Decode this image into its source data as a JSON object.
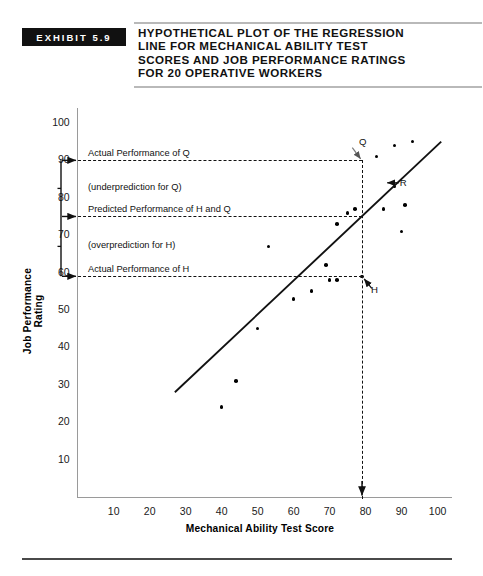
{
  "exhibit": {
    "badge": "EXHIBIT 5.9",
    "title_lines": [
      "HYPOTHETICAL PLOT OF THE REGRESSION",
      "LINE FOR MECHANICAL ABILITY TEST",
      "SCORES AND JOB PERFORMANCE RATINGS",
      "FOR 20 OPERATIVE WORKERS"
    ]
  },
  "chart_data": {
    "type": "scatter",
    "title": "Hypothetical Plot of the Regression Line for Mechanical Ability Test Scores and Job Performance Ratings for 20 Operative Workers",
    "xlabel": "Mechanical Ability Test Score",
    "ylabel": "Job Performance Rating",
    "xlim": [
      0,
      104
    ],
    "ylim": [
      0,
      104
    ],
    "xticks": [
      10,
      20,
      30,
      40,
      50,
      60,
      70,
      80,
      90,
      100
    ],
    "yticks": [
      10,
      20,
      30,
      40,
      50,
      60,
      70,
      80,
      90,
      100
    ],
    "grid": false,
    "legend": "none",
    "points": [
      {
        "x": 40,
        "y": 24
      },
      {
        "x": 44,
        "y": 31
      },
      {
        "x": 50,
        "y": 45
      },
      {
        "x": 53,
        "y": 67
      },
      {
        "x": 60,
        "y": 53
      },
      {
        "x": 65,
        "y": 55
      },
      {
        "x": 69,
        "y": 62
      },
      {
        "x": 70,
        "y": 58
      },
      {
        "x": 72,
        "y": 58
      },
      {
        "x": 72,
        "y": 73
      },
      {
        "x": 75,
        "y": 76
      },
      {
        "x": 77,
        "y": 77
      },
      {
        "x": 79,
        "y": 59
      },
      {
        "x": 83,
        "y": 91
      },
      {
        "x": 85,
        "y": 77
      },
      {
        "x": 88,
        "y": 94
      },
      {
        "x": 88,
        "y": 83
      },
      {
        "x": 90,
        "y": 71
      },
      {
        "x": 91,
        "y": 78
      },
      {
        "x": 93,
        "y": 95
      }
    ],
    "regression_line": {
      "x0": 27,
      "y0": 28,
      "x1": 101,
      "y1": 95
    },
    "reference_lines": [
      {
        "orientation": "horizontal",
        "value": 90,
        "style": "dashed",
        "label": "Actual Performance of Q"
      },
      {
        "orientation": "horizontal",
        "value": 75,
        "style": "dashed",
        "label": "Predicted Performance of H and Q"
      },
      {
        "orientation": "horizontal",
        "value": 59,
        "style": "dashed",
        "label": "Actual Performance of H"
      },
      {
        "orientation": "vertical",
        "value": 79,
        "style": "dashed",
        "label": ""
      }
    ],
    "bracket_annotations": [
      {
        "label": "(underprediction for Q)",
        "from": 75,
        "to": 90
      },
      {
        "label": "(overprediction for H)",
        "from": 59,
        "to": 75
      }
    ],
    "point_labels": [
      {
        "text": "Q",
        "x": 79,
        "y": 90
      },
      {
        "text": "R",
        "x": 86,
        "y": 84
      },
      {
        "text": "H",
        "x": 79,
        "y": 59
      }
    ]
  }
}
